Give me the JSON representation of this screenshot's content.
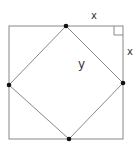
{
  "diagram": {
    "outer_square": {
      "x1": 9,
      "y1": 26,
      "x2": 123,
      "y2": 139
    },
    "inner_square_vertices": [
      {
        "name": "top",
        "x": 66,
        "y": 26
      },
      {
        "name": "right",
        "x": 123,
        "y": 83
      },
      {
        "name": "bottom",
        "x": 69,
        "y": 139
      },
      {
        "name": "left",
        "x": 9,
        "y": 85
      }
    ],
    "labels": {
      "top_segment": "x",
      "right_segment": "x",
      "hypotenuse": "y"
    },
    "colors": {
      "lines": "#888888",
      "dots": "#111111"
    }
  }
}
